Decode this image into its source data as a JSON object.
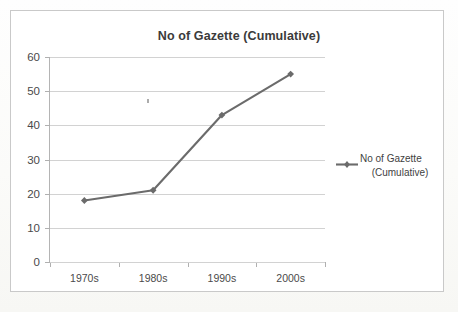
{
  "chart_data": {
    "type": "line",
    "title": "No of Gazette (Cumulative)",
    "xlabel": "",
    "ylabel": "",
    "categories": [
      "1970s",
      "1980s",
      "1990s",
      "2000s"
    ],
    "values": [
      18,
      21,
      43,
      55
    ],
    "series": [
      {
        "name": "No of Gazette (Cumulative)",
        "values": [
          18,
          21,
          43,
          55
        ]
      }
    ],
    "ylim": [
      0,
      60
    ],
    "y_ticks": [
      0,
      10,
      20,
      30,
      40,
      50,
      60
    ],
    "y_tick_labels": [
      "0",
      "10",
      "20",
      "30",
      "40",
      "50",
      "60"
    ],
    "grid": true,
    "legend_position": "right",
    "legend_entries": [
      "No of Gazette (Cumulative)"
    ],
    "line_color": "#6b6b6b",
    "marker": "diamond",
    "marker_color": "#6b6b6b"
  },
  "legend": {
    "line_1": "No of Gazette",
    "line_2": "(Cumulative)"
  },
  "colors": {
    "series": "#6b6b6b",
    "gridline": "#d2d2d2",
    "axis": "#a8a8a8",
    "title_text": "#3b3b3b",
    "tick_text": "#4a4a4a",
    "frame_border": "#c9c9c9",
    "plot_background": "#ffffff"
  }
}
